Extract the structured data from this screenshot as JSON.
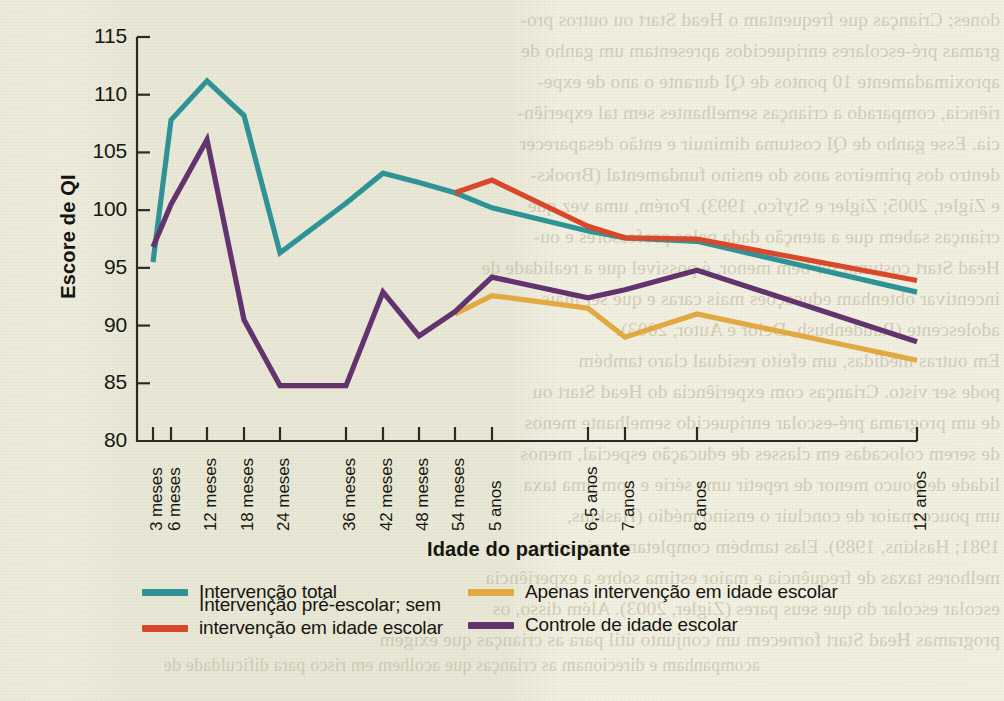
{
  "chart_data": {
    "type": "line",
    "title": "",
    "xlabel": "Idade do participante",
    "ylabel": "Escore de QI",
    "ylim": [
      80,
      115
    ],
    "yticks": [
      80,
      85,
      90,
      95,
      100,
      105,
      110,
      115
    ],
    "grid": false,
    "legend_position": "bottom",
    "categories": [
      "3 meses",
      "6 meses",
      "12 meses",
      "18 meses",
      "24 meses",
      "36 meses",
      "42 meses",
      "48 meses",
      "54 meses",
      "5 anos",
      "6,5 anos",
      "7 anos",
      "8 anos",
      "12 anos"
    ],
    "series": [
      {
        "name": "Intervenção total",
        "color": "#2f9396",
        "values": [
          95.5,
          107.8,
          111.2,
          108.2,
          96.3,
          100.6,
          103.2,
          102.4,
          101.5,
          100.2,
          98.2,
          97.6,
          97.3,
          92.9
        ]
      },
      {
        "name": "Intervenção pré-escolar; sem\nintervenção em idade escolar",
        "color": "#d9482a",
        "values": [
          null,
          null,
          null,
          null,
          null,
          null,
          null,
          null,
          101.5,
          102.6,
          98.6,
          97.6,
          97.5,
          93.9
        ]
      },
      {
        "name": "Apenas intervenção em idade escolar",
        "color": "#e1a93f",
        "values": [
          null,
          null,
          null,
          null,
          null,
          null,
          null,
          null,
          91.0,
          92.6,
          91.5,
          89.0,
          91.0,
          87.0
        ]
      },
      {
        "name": "Controle de idade escolar",
        "color": "#62336d",
        "values": [
          96.8,
          100.5,
          106.1,
          90.5,
          84.8,
          84.8,
          92.9,
          89.1,
          91.2,
          94.2,
          92.4,
          93.1,
          94.8,
          88.6
        ]
      }
    ]
  },
  "axis": {
    "y_title": "Escore de QI",
    "x_title": "Idade do participante",
    "y_ticks": [
      "115",
      "110",
      "105",
      "100",
      "95",
      "90",
      "85",
      "80"
    ],
    "x_ticks": [
      "3 meses",
      "6 meses",
      "12 meses",
      "18 meses",
      "24 meses",
      "36 meses",
      "42 meses",
      "48 meses",
      "54 meses",
      "5 anos",
      "6,5 anos",
      "7 anos",
      "8 anos",
      "12 anos"
    ]
  },
  "legend": {
    "items": [
      {
        "label": "Intervenção total",
        "color": "#2f9396"
      },
      {
        "label": "Intervenção pré-escolar; sem\nintervenção em idade escolar",
        "color": "#d9482a"
      },
      {
        "label": "Apenas intervenção em idade escolar",
        "color": "#e1a93f"
      },
      {
        "label": "Controle de idade escolar",
        "color": "#62336d"
      }
    ]
  },
  "background": {
    "paper_color": "#efeedd",
    "bleed_through_right": [
      "dones; Crianças que frequentam o Head Start ou outros pro-",
      "gramas pré-escolares enriquecidos apresentam um ganho de",
      "aproximadamente 10 pontos de QI durante o ano de expe-",
      "riência, comparado a crianças semelhantes sem tal experiên-",
      "cia. Esse ganho de QI costuma diminuir e então desaparecer",
      "dentro dos primeiros anos do ensino fundamental (Brooks-",
      "e Zigler, 2005; Zigler e Styfco, 1993). Porém, uma vez que",
      "crianças sabem que a atenção dada pelos professores e ou-",
      "Head Start costuma ser bem menor, é possível que a realidade de",
      "incentivar obtenham educações mais caras e que ser mais",
      "adolescente (Raudenbush, Delor e Autor, 2003).",
      "Em outras medidas, um efeito residual claro também",
      "pode ser visto. Crianças com experiência do Head Start ou",
      "de um programa pré-escolar enriquecido semelhante menos",
      "de serem colocadas em classes de educação especial, menos",
      "lidade de pouco menor de repetir uma série e com uma taxa",
      "um pouco maior de concluir o ensino médio (Haskins,",
      "1981; Haskins, 1989). Elas também completam mais anos",
      "melhores taxas de frequência e maior estima sobre a experiência",
      "escolar escolar do que seus pares (Zigler, 2003). Além disso, os",
      "programas Head Start fornecem um conjunto útil para as crianças que exigem"
    ],
    "bleed_through_left": [
      "acompanham e direcionam as crianças que acolhem em risco para dificuldade de"
    ]
  }
}
